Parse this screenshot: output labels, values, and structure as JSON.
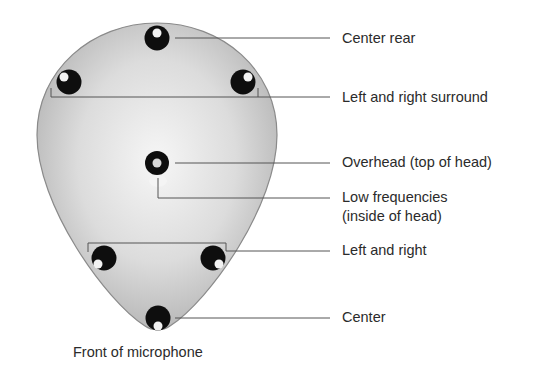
{
  "diagram": {
    "caption": "Front of microphone",
    "colors": {
      "head_fill_light": "#f4f4f4",
      "head_fill_dark": "#b4b4b4",
      "head_outline": "#8a8a8a",
      "capsule": "#111111",
      "leader_line": "#555555",
      "label_text": "#2b2b2b"
    },
    "capsules": [
      {
        "id": "center-rear",
        "label": "Center rear"
      },
      {
        "id": "left-surround",
        "label": "Left and right surround"
      },
      {
        "id": "right-surround",
        "label": "Left and right surround"
      },
      {
        "id": "overhead",
        "label": "Overhead (top of head)"
      },
      {
        "id": "low-frequencies",
        "label": "Low frequencies (inside of head)"
      },
      {
        "id": "left-front",
        "label": "Left and right"
      },
      {
        "id": "right-front",
        "label": "Left and right"
      },
      {
        "id": "center-front",
        "label": "Center"
      }
    ],
    "labels": {
      "center_rear": "Center rear",
      "surround": "Left and right surround",
      "overhead": "Overhead (top of head)",
      "low_freq_line1": "Low frequencies",
      "low_freq_line2": "(inside of head)",
      "left_right": "Left and right",
      "center": "Center"
    }
  }
}
